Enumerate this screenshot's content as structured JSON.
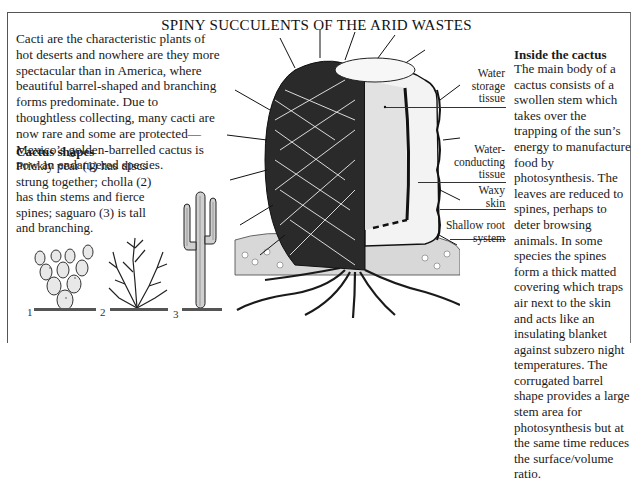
{
  "title": "SPINY SUCCULENTS OF THE ARID WASTES",
  "intro": "Cacti are the characteristic plants of hot deserts and nowhere are they more spectacular than in America, where beautiful barrel-shaped and branching forms predominate. Due to thoughtless collecting, many cacti are now rare and some are protected—Mexico’s golden-barrelled cactus is now an endangered species.",
  "cactus_shapes": {
    "heading": "Cactus shapes",
    "text": "Prickly pear (1) has discs strung together; cholla (2) has thin stems and fierce spines; saguaro (3) is tall and branching.",
    "figures": [
      {
        "number": "1",
        "name": "prickly-pear"
      },
      {
        "number": "2",
        "name": "cholla"
      },
      {
        "number": "3",
        "name": "saguaro"
      }
    ]
  },
  "diagram_labels": [
    {
      "text": "Water storage tissue"
    },
    {
      "text": "Water-conducting tissue"
    },
    {
      "text": "Waxy skin"
    },
    {
      "text": "Shallow root system"
    }
  ],
  "inside": {
    "heading": "Inside the cactus",
    "text": "The main body of a cactus consists of a swollen stem which takes over the trapping of the sun’s energy to manufacture food by photosynthesis. The leaves are reduced to spines, perhaps to deter browsing animals. In some species the spines form a thick matted covering which traps air next to the skin and acts like an insulating blanket against subzero night temperatures. The corrugated barrel shape provides a large stem area for photosynthesis but at the same time reduces the surface/volume ratio."
  }
}
